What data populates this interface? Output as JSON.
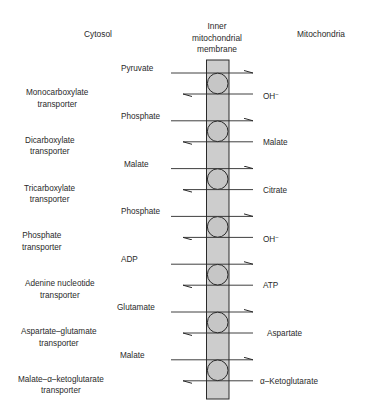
{
  "headers": {
    "left": "Cytosol",
    "center": [
      "Inner",
      "mitochondrial",
      "membrane"
    ],
    "right": "Mitochondria"
  },
  "colors": {
    "membrane_fill": "#cdcdcd",
    "carrier_fill": "#c6c6c6",
    "line": "#2a2a2a"
  },
  "transporters": [
    {
      "name": [
        "Monocarboxylate",
        "transporter"
      ],
      "inbound": "Pyruvate",
      "outbound": "OH−"
    },
    {
      "name": [
        "Dicarboxylate",
        "transporter"
      ],
      "inbound": "Phosphate",
      "outbound": "Malate"
    },
    {
      "name": [
        "Tricarboxylate",
        "transporter"
      ],
      "inbound": "Malate",
      "outbound": "Citrate"
    },
    {
      "name": [
        "Phosphate",
        "transporter"
      ],
      "inbound": "Phosphate",
      "outbound": "OH−"
    },
    {
      "name": [
        "Adenine nucleotide",
        "transporter"
      ],
      "inbound": "ADP",
      "outbound": "ATP"
    },
    {
      "name": [
        "Aspartate–glutamate",
        "transporter"
      ],
      "inbound": "Glutamate",
      "outbound": "Aspartate"
    },
    {
      "name": [
        "Malate–α–ketoglutarate",
        "transporter"
      ],
      "inbound": "Malate",
      "outbound": "α–Ketoglutarate"
    }
  ]
}
